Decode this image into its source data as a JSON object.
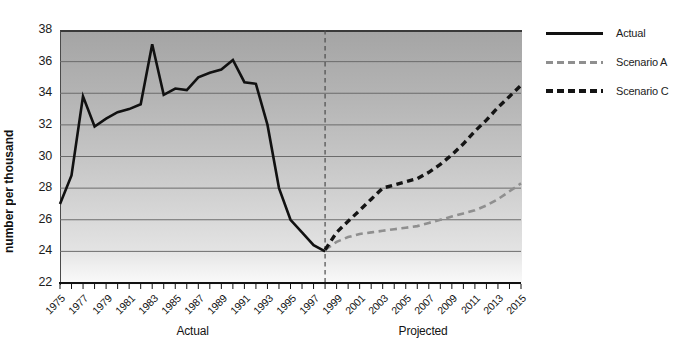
{
  "legend": [
    {
      "label": "Actual",
      "style": "solid",
      "color": "#111111",
      "thickness": 3,
      "dash": 7,
      "gap": 4
    },
    {
      "label": "Scenario A",
      "style": "dashed",
      "color": "#8f8f8f",
      "thickness": 3,
      "dash": 7,
      "gap": 4
    },
    {
      "label": "Scenario C",
      "style": "dashed",
      "color": "#141414",
      "thickness": 4,
      "dash": 7,
      "gap": 4
    }
  ],
  "chart_data": {
    "type": "line",
    "title": "",
    "ylabel": "number per thousand",
    "xlabel": "",
    "ylim": [
      22,
      38
    ],
    "xlim": [
      1975,
      2015
    ],
    "y_ticks": [
      38,
      36,
      34,
      32,
      30,
      28,
      26,
      24,
      22
    ],
    "x_ticks_labeled": [
      1975,
      1977,
      1979,
      1981,
      1983,
      1985,
      1987,
      1989,
      1991,
      1993,
      1995,
      1997,
      1999,
      2001,
      2003,
      2005,
      2007,
      2009,
      2011,
      2013,
      2015
    ],
    "x_tick_interval": 1,
    "grid": true,
    "legend_position": "right",
    "divider_x": 1998,
    "x_section_labels": [
      {
        "label": "Actual",
        "center_year": 1986.5
      },
      {
        "label": "Projected",
        "center_year": 2006.5
      }
    ],
    "colors": {
      "gridline": "#6b6b6b",
      "axis": "#111111",
      "divider": "#4a4a4a",
      "plot_bg_top": "#a5a5a5",
      "plot_bg_bottom": "#fafafa"
    },
    "series": [
      {
        "name": "Actual",
        "style": "solid",
        "color": "#111111",
        "width": 2.6,
        "x": [
          1975,
          1976,
          1977,
          1978,
          1979,
          1980,
          1981,
          1982,
          1983,
          1984,
          1985,
          1986,
          1987,
          1988,
          1989,
          1990,
          1991,
          1992,
          1993,
          1994,
          1995,
          1996,
          1997,
          1998
        ],
        "values": [
          27.0,
          28.8,
          33.8,
          31.9,
          32.4,
          32.8,
          33.0,
          33.3,
          37.1,
          33.9,
          34.3,
          34.2,
          35.0,
          35.3,
          35.5,
          36.1,
          34.7,
          34.6,
          32.0,
          28.0,
          26.0,
          25.2,
          24.4,
          24.0
        ]
      },
      {
        "name": "Scenario A",
        "style": "dashed",
        "color": "#8f8f8f",
        "width": 2.6,
        "dasharray": "7 4.5",
        "x": [
          1998,
          1999,
          2000,
          2001,
          2002,
          2003,
          2004,
          2005,
          2006,
          2007,
          2008,
          2009,
          2010,
          2011,
          2012,
          2013,
          2014,
          2015
        ],
        "values": [
          24.1,
          24.6,
          24.9,
          25.1,
          25.2,
          25.3,
          25.4,
          25.5,
          25.6,
          25.8,
          26.0,
          26.2,
          26.4,
          26.6,
          26.9,
          27.3,
          27.8,
          28.3
        ]
      },
      {
        "name": "Scenario C",
        "style": "dashed",
        "color": "#141414",
        "width": 3.4,
        "dasharray": "6.5 4.5",
        "x": [
          1998,
          1999,
          2000,
          2001,
          2002,
          2003,
          2004,
          2005,
          2006,
          2007,
          2008,
          2009,
          2010,
          2011,
          2012,
          2013,
          2014,
          2015
        ],
        "values": [
          24.1,
          25.2,
          25.9,
          26.6,
          27.3,
          28.0,
          28.2,
          28.4,
          28.6,
          29.0,
          29.5,
          30.1,
          30.8,
          31.6,
          32.3,
          33.1,
          33.8,
          34.5
        ]
      }
    ]
  }
}
